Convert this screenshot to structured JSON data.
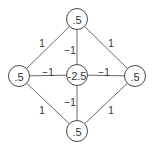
{
  "diagram": {
    "colors": {
      "stroke": "#4a4a4a",
      "edge": "#6a6a6a",
      "text": "#333333",
      "background": "#ffffff"
    },
    "nodes": [
      {
        "id": "top",
        "label": ".5",
        "x": 77,
        "y": 19
      },
      {
        "id": "left",
        "label": ".5",
        "x": 19,
        "y": 76
      },
      {
        "id": "center",
        "label": "-2.5",
        "x": 77,
        "y": 75
      },
      {
        "id": "right",
        "label": ".5",
        "x": 135,
        "y": 76
      },
      {
        "id": "bottom",
        "label": ".5",
        "x": 77,
        "y": 131
      }
    ],
    "edges": [
      {
        "from": "top",
        "to": "left",
        "label": "1",
        "lx": 42,
        "ly": 43
      },
      {
        "from": "top",
        "to": "right",
        "label": "1",
        "lx": 111,
        "ly": 43
      },
      {
        "from": "top",
        "to": "center",
        "label": "−1",
        "lx": 70,
        "ly": 50
      },
      {
        "from": "left",
        "to": "center",
        "label": "−1",
        "lx": 48,
        "ly": 72
      },
      {
        "from": "center",
        "to": "right",
        "label": "−1",
        "lx": 104,
        "ly": 72
      },
      {
        "from": "center",
        "to": "bottom",
        "label": "−1",
        "lx": 70,
        "ly": 102
      },
      {
        "from": "left",
        "to": "bottom",
        "label": "1",
        "lx": 42,
        "ly": 110
      },
      {
        "from": "right",
        "to": "bottom",
        "label": "1",
        "lx": 111,
        "ly": 110
      }
    ]
  }
}
